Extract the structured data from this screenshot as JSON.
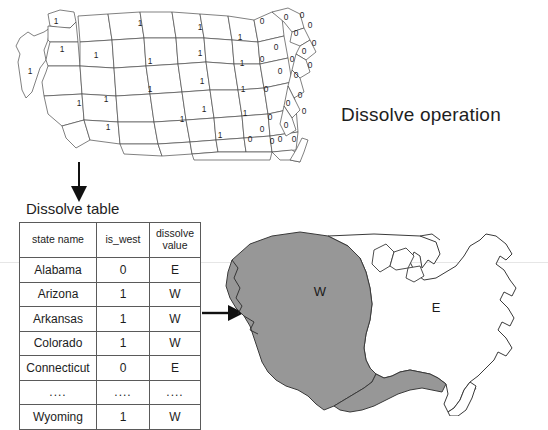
{
  "title": "Dissolve operation",
  "source_map": {
    "name": "us-states-is-west-map",
    "west_value": "1",
    "east_value": "0",
    "west_label_points": [
      [
        26,
        72
      ],
      [
        52,
        22
      ],
      [
        58,
        50
      ],
      [
        92,
        56
      ],
      [
        75,
        104
      ],
      [
        102,
        100
      ],
      [
        104,
        128
      ],
      [
        136,
        24
      ],
      [
        146,
        62
      ],
      [
        146,
        90
      ],
      [
        178,
        120
      ],
      [
        196,
        28
      ],
      [
        196,
        54
      ],
      [
        198,
        82
      ],
      [
        200,
        110
      ],
      [
        216,
        136
      ],
      [
        236,
        38
      ],
      [
        238,
        64
      ],
      [
        239,
        90
      ],
      [
        241,
        114
      ]
    ],
    "east_label_points": [
      [
        258,
        60
      ],
      [
        262,
        90
      ],
      [
        266,
        118
      ],
      [
        276,
        140
      ],
      [
        258,
        22
      ],
      [
        282,
        18
      ],
      [
        292,
        34
      ],
      [
        300,
        52
      ],
      [
        298,
        16
      ],
      [
        306,
        26
      ],
      [
        288,
        60
      ],
      [
        292,
        76
      ],
      [
        296,
        96
      ],
      [
        300,
        112
      ],
      [
        284,
        104
      ],
      [
        268,
        142
      ],
      [
        282,
        126
      ],
      [
        290,
        140
      ],
      [
        272,
        48
      ],
      [
        246,
        140
      ],
      [
        276,
        72
      ],
      [
        258,
        130
      ],
      [
        306,
        66
      ],
      [
        310,
        44
      ]
    ]
  },
  "arrows": {
    "down": "arrow-down",
    "right": "arrow-right"
  },
  "table": {
    "caption": "Dissolve table",
    "columns": [
      "state name",
      "is_west",
      "dissolve value"
    ],
    "column_header_lines": [
      [
        "state name"
      ],
      [
        "is_west"
      ],
      [
        "dissolve",
        "value"
      ]
    ],
    "rows": [
      [
        "Alabama",
        "0",
        "E"
      ],
      [
        "Arizona",
        "1",
        "W"
      ],
      [
        "Arkansas",
        "1",
        "W"
      ],
      [
        "Colorado",
        "1",
        "W"
      ],
      [
        "Connecticut",
        "0",
        "E"
      ],
      [
        "....",
        "....",
        "...."
      ],
      [
        "Wyoming",
        "1",
        "W"
      ]
    ]
  },
  "dissolved_map": {
    "name": "us-dissolved-west-east-map",
    "west_label": "W",
    "east_label": "E",
    "west_fill": "#979797",
    "east_fill": "#ffffff",
    "outline": "#3a3a3a"
  }
}
